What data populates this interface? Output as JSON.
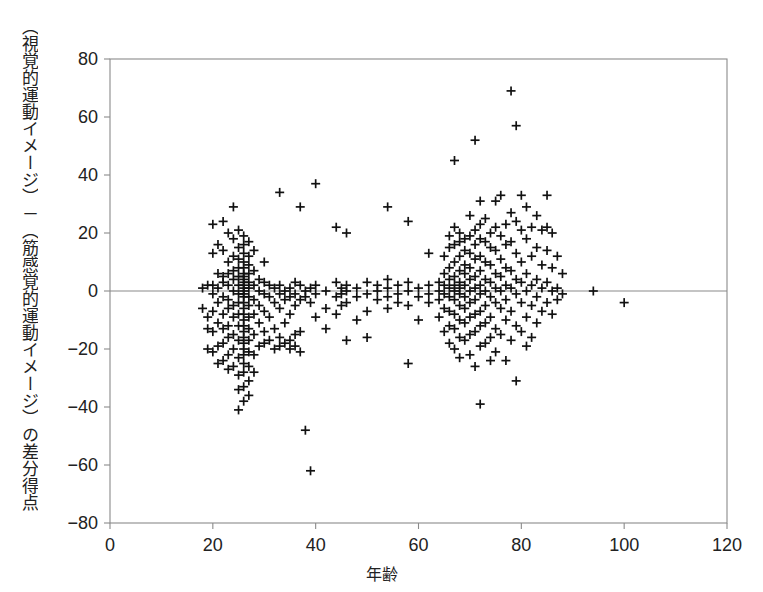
{
  "figure": {
    "ylabel": "（視覚的運動イメージ）－（筋感覚的運動イメージ）の差分得点",
    "xlabel": "年齢",
    "background": "#ffffff",
    "marker_color": "#111111",
    "axis_color": "#8a8a8a"
  },
  "chart_data": {
    "type": "scatter",
    "title": "",
    "xlabel": "年齢",
    "ylabel": "（視覚的運動イメージ）－（筋感覚的運動イメージ）の差分得点",
    "xlim": [
      0,
      120
    ],
    "ylim": [
      -80,
      80
    ],
    "xticks": [
      0,
      20,
      40,
      60,
      80,
      100,
      120
    ],
    "yticks": [
      -80,
      -60,
      -40,
      -20,
      0,
      20,
      40,
      60,
      80
    ],
    "xtick_labels": [
      "0",
      "20",
      "40",
      "60",
      "80",
      "100",
      "120"
    ],
    "ytick_labels": [
      "-80",
      "-60",
      "-40",
      "-20",
      "0",
      "20",
      "40",
      "60",
      "80"
    ],
    "grid": false,
    "legend": false,
    "marker": "plus",
    "zero_line": 0,
    "n_points": 286,
    "points": [
      [
        18,
        1
      ],
      [
        18,
        -6
      ],
      [
        19,
        2
      ],
      [
        19,
        -13
      ],
      [
        19,
        -20
      ],
      [
        19,
        -9
      ],
      [
        20,
        23
      ],
      [
        20,
        13
      ],
      [
        20,
        2
      ],
      [
        20,
        -1
      ],
      [
        20,
        -7
      ],
      [
        20,
        -14
      ],
      [
        20,
        -21
      ],
      [
        21,
        16
      ],
      [
        21,
        6
      ],
      [
        21,
        1
      ],
      [
        21,
        -4
      ],
      [
        21,
        -11
      ],
      [
        21,
        -19
      ],
      [
        21,
        -25
      ],
      [
        22,
        24
      ],
      [
        22,
        14
      ],
      [
        22,
        5
      ],
      [
        22,
        3
      ],
      [
        22,
        -2
      ],
      [
        22,
        -8
      ],
      [
        22,
        -13
      ],
      [
        22,
        -18
      ],
      [
        22,
        -24
      ],
      [
        23,
        20
      ],
      [
        23,
        10
      ],
      [
        23,
        6
      ],
      [
        23,
        2
      ],
      [
        23,
        -3
      ],
      [
        23,
        -6
      ],
      [
        23,
        -12
      ],
      [
        23,
        -16
      ],
      [
        23,
        -22
      ],
      [
        23,
        -27
      ],
      [
        24,
        29
      ],
      [
        24,
        18
      ],
      [
        24,
        12
      ],
      [
        24,
        7
      ],
      [
        24,
        4
      ],
      [
        24,
        0
      ],
      [
        24,
        -5
      ],
      [
        24,
        -9
      ],
      [
        24,
        -15
      ],
      [
        24,
        -20
      ],
      [
        24,
        -26
      ],
      [
        25,
        21
      ],
      [
        25,
        15
      ],
      [
        25,
        11
      ],
      [
        25,
        8
      ],
      [
        25,
        5
      ],
      [
        25,
        2
      ],
      [
        25,
        -1
      ],
      [
        25,
        -4
      ],
      [
        25,
        -8
      ],
      [
        25,
        -12
      ],
      [
        25,
        -17
      ],
      [
        25,
        -23
      ],
      [
        25,
        -29
      ],
      [
        25,
        -34
      ],
      [
        25,
        -41
      ],
      [
        26,
        19
      ],
      [
        26,
        16
      ],
      [
        26,
        13
      ],
      [
        26,
        10
      ],
      [
        26,
        8
      ],
      [
        26,
        6
      ],
      [
        26,
        5
      ],
      [
        26,
        4
      ],
      [
        26,
        3
      ],
      [
        26,
        2
      ],
      [
        26,
        1
      ],
      [
        26,
        0
      ],
      [
        26,
        -1
      ],
      [
        26,
        -2
      ],
      [
        26,
        -4
      ],
      [
        26,
        -6
      ],
      [
        26,
        -8
      ],
      [
        26,
        -10
      ],
      [
        26,
        -12
      ],
      [
        26,
        -14
      ],
      [
        26,
        -16
      ],
      [
        26,
        -18
      ],
      [
        26,
        -20
      ],
      [
        26,
        -22
      ],
      [
        26,
        -25
      ],
      [
        26,
        -28
      ],
      [
        26,
        -33
      ],
      [
        26,
        -38
      ],
      [
        27,
        17
      ],
      [
        27,
        12
      ],
      [
        27,
        9
      ],
      [
        27,
        6
      ],
      [
        27,
        3
      ],
      [
        27,
        1
      ],
      [
        27,
        -2
      ],
      [
        27,
        -5
      ],
      [
        27,
        -9
      ],
      [
        27,
        -13
      ],
      [
        27,
        -17
      ],
      [
        27,
        -21
      ],
      [
        27,
        -26
      ],
      [
        27,
        -31
      ],
      [
        27,
        -36
      ],
      [
        28,
        14
      ],
      [
        28,
        7
      ],
      [
        28,
        2
      ],
      [
        28,
        -3
      ],
      [
        28,
        -8
      ],
      [
        28,
        -15
      ],
      [
        28,
        -22
      ],
      [
        28,
        -28
      ],
      [
        29,
        4
      ],
      [
        29,
        0
      ],
      [
        29,
        -5
      ],
      [
        29,
        -11
      ],
      [
        29,
        -19
      ],
      [
        30,
        10
      ],
      [
        30,
        3
      ],
      [
        30,
        -1
      ],
      [
        30,
        -7
      ],
      [
        30,
        -14
      ],
      [
        30,
        -18
      ],
      [
        31,
        2
      ],
      [
        31,
        -2
      ],
      [
        31,
        -9
      ],
      [
        31,
        -17
      ],
      [
        32,
        1
      ],
      [
        32,
        -4
      ],
      [
        32,
        -13
      ],
      [
        32,
        -20
      ],
      [
        33,
        34
      ],
      [
        33,
        2
      ],
      [
        33,
        -1
      ],
      [
        33,
        -6
      ],
      [
        33,
        -16
      ],
      [
        33,
        -19
      ],
      [
        34,
        0
      ],
      [
        34,
        -3
      ],
      [
        34,
        -11
      ],
      [
        34,
        -18
      ],
      [
        35,
        1
      ],
      [
        35,
        -2
      ],
      [
        35,
        -8
      ],
      [
        35,
        -17
      ],
      [
        35,
        -20
      ],
      [
        36,
        3
      ],
      [
        36,
        -1
      ],
      [
        36,
        -5
      ],
      [
        36,
        -15
      ],
      [
        36,
        -19
      ],
      [
        37,
        29
      ],
      [
        37,
        2
      ],
      [
        37,
        -3
      ],
      [
        37,
        -14
      ],
      [
        37,
        -21
      ],
      [
        38,
        0
      ],
      [
        38,
        -2
      ],
      [
        38,
        -48
      ],
      [
        39,
        1
      ],
      [
        39,
        -4
      ],
      [
        39,
        -62
      ],
      [
        40,
        37
      ],
      [
        40,
        2
      ],
      [
        40,
        -1
      ],
      [
        40,
        -9
      ],
      [
        42,
        0
      ],
      [
        42,
        -6
      ],
      [
        42,
        -13
      ],
      [
        44,
        22
      ],
      [
        44,
        3
      ],
      [
        44,
        -2
      ],
      [
        44,
        -8
      ],
      [
        45,
        1
      ],
      [
        45,
        -1
      ],
      [
        45,
        -5
      ],
      [
        46,
        20
      ],
      [
        46,
        2
      ],
      [
        46,
        0
      ],
      [
        46,
        -4
      ],
      [
        46,
        -17
      ],
      [
        48,
        1
      ],
      [
        48,
        -2
      ],
      [
        48,
        -10
      ],
      [
        50,
        3
      ],
      [
        50,
        -1
      ],
      [
        50,
        -7
      ],
      [
        50,
        -16
      ],
      [
        52,
        2
      ],
      [
        52,
        0
      ],
      [
        52,
        -3
      ],
      [
        54,
        29
      ],
      [
        54,
        4
      ],
      [
        54,
        1
      ],
      [
        54,
        -2
      ],
      [
        54,
        -6
      ],
      [
        56,
        2
      ],
      [
        56,
        -1
      ],
      [
        56,
        -4
      ],
      [
        58,
        24
      ],
      [
        58,
        3
      ],
      [
        58,
        0
      ],
      [
        58,
        -5
      ],
      [
        58,
        -25
      ],
      [
        60,
        1
      ],
      [
        60,
        -2
      ],
      [
        60,
        -10
      ],
      [
        62,
        13
      ],
      [
        62,
        2
      ],
      [
        62,
        -1
      ],
      [
        62,
        -4
      ],
      [
        64,
        3
      ],
      [
        64,
        0
      ],
      [
        64,
        -3
      ],
      [
        64,
        -9
      ],
      [
        65,
        12
      ],
      [
        65,
        6
      ],
      [
        65,
        2
      ],
      [
        65,
        -1
      ],
      [
        65,
        -6
      ],
      [
        65,
        -14
      ],
      [
        66,
        19
      ],
      [
        66,
        15
      ],
      [
        66,
        8
      ],
      [
        66,
        4
      ],
      [
        66,
        1
      ],
      [
        66,
        -2
      ],
      [
        66,
        -7
      ],
      [
        66,
        -12
      ],
      [
        66,
        -18
      ],
      [
        67,
        45
      ],
      [
        67,
        22
      ],
      [
        67,
        16
      ],
      [
        67,
        10
      ],
      [
        67,
        5
      ],
      [
        67,
        2
      ],
      [
        67,
        0
      ],
      [
        67,
        -3
      ],
      [
        67,
        -8
      ],
      [
        67,
        -13
      ],
      [
        67,
        -20
      ],
      [
        68,
        20
      ],
      [
        68,
        17
      ],
      [
        68,
        12
      ],
      [
        68,
        7
      ],
      [
        68,
        3
      ],
      [
        68,
        1
      ],
      [
        68,
        -1
      ],
      [
        68,
        -5
      ],
      [
        68,
        -10
      ],
      [
        68,
        -16
      ],
      [
        68,
        -23
      ],
      [
        69,
        18
      ],
      [
        69,
        14
      ],
      [
        69,
        9
      ],
      [
        69,
        6
      ],
      [
        69,
        2
      ],
      [
        69,
        -2
      ],
      [
        69,
        -6
      ],
      [
        69,
        -11
      ],
      [
        69,
        -17
      ],
      [
        70,
        26
      ],
      [
        70,
        19
      ],
      [
        70,
        13
      ],
      [
        70,
        8
      ],
      [
        70,
        4
      ],
      [
        70,
        0
      ],
      [
        70,
        -4
      ],
      [
        70,
        -9
      ],
      [
        70,
        -15
      ],
      [
        70,
        -22
      ],
      [
        71,
        52
      ],
      [
        71,
        21
      ],
      [
        71,
        16
      ],
      [
        71,
        11
      ],
      [
        71,
        5
      ],
      [
        71,
        1
      ],
      [
        71,
        -3
      ],
      [
        71,
        -8
      ],
      [
        71,
        -14
      ],
      [
        71,
        -26
      ],
      [
        72,
        31
      ],
      [
        72,
        23
      ],
      [
        72,
        18
      ],
      [
        72,
        12
      ],
      [
        72,
        7
      ],
      [
        72,
        2
      ],
      [
        72,
        -1
      ],
      [
        72,
        -7
      ],
      [
        72,
        -12
      ],
      [
        72,
        -19
      ],
      [
        72,
        -39
      ],
      [
        73,
        25
      ],
      [
        73,
        17
      ],
      [
        73,
        10
      ],
      [
        73,
        4
      ],
      [
        73,
        0
      ],
      [
        73,
        -5
      ],
      [
        73,
        -11
      ],
      [
        73,
        -18
      ],
      [
        74,
        20
      ],
      [
        74,
        15
      ],
      [
        74,
        9
      ],
      [
        74,
        3
      ],
      [
        74,
        -2
      ],
      [
        74,
        -9
      ],
      [
        74,
        -16
      ],
      [
        74,
        -24
      ],
      [
        75,
        31
      ],
      [
        75,
        22
      ],
      [
        75,
        14
      ],
      [
        75,
        6
      ],
      [
        75,
        1
      ],
      [
        75,
        -4
      ],
      [
        75,
        -13
      ],
      [
        75,
        -21
      ],
      [
        76,
        33
      ],
      [
        76,
        19
      ],
      [
        76,
        11
      ],
      [
        76,
        5
      ],
      [
        76,
        0
      ],
      [
        76,
        -6
      ],
      [
        76,
        -15
      ],
      [
        77,
        23
      ],
      [
        77,
        16
      ],
      [
        77,
        8
      ],
      [
        77,
        2
      ],
      [
        77,
        -3
      ],
      [
        77,
        -10
      ],
      [
        77,
        -24
      ],
      [
        78,
        69
      ],
      [
        78,
        27
      ],
      [
        78,
        17
      ],
      [
        78,
        7
      ],
      [
        78,
        1
      ],
      [
        78,
        -7
      ],
      [
        78,
        -17
      ],
      [
        79,
        57
      ],
      [
        79,
        24
      ],
      [
        79,
        13
      ],
      [
        79,
        4
      ],
      [
        79,
        -1
      ],
      [
        79,
        -12
      ],
      [
        79,
        -31
      ],
      [
        80,
        33
      ],
      [
        80,
        21
      ],
      [
        80,
        10
      ],
      [
        80,
        3
      ],
      [
        80,
        -4
      ],
      [
        80,
        -14
      ],
      [
        81,
        29
      ],
      [
        81,
        18
      ],
      [
        81,
        6
      ],
      [
        81,
        0
      ],
      [
        81,
        -9
      ],
      [
        81,
        -19
      ],
      [
        82,
        22
      ],
      [
        82,
        12
      ],
      [
        82,
        2
      ],
      [
        82,
        -5
      ],
      [
        82,
        -16
      ],
      [
        83,
        26
      ],
      [
        83,
        15
      ],
      [
        83,
        4
      ],
      [
        83,
        -2
      ],
      [
        83,
        -11
      ],
      [
        84,
        21
      ],
      [
        84,
        9
      ],
      [
        84,
        1
      ],
      [
        84,
        -7
      ],
      [
        85,
        33
      ],
      [
        85,
        22
      ],
      [
        85,
        14
      ],
      [
        85,
        3
      ],
      [
        85,
        -4
      ],
      [
        86,
        20
      ],
      [
        86,
        8
      ],
      [
        86,
        0
      ],
      [
        86,
        -8
      ],
      [
        87,
        12
      ],
      [
        87,
        1
      ],
      [
        87,
        -3
      ],
      [
        88,
        6
      ],
      [
        88,
        -1
      ],
      [
        94,
        0
      ],
      [
        100,
        -4
      ]
    ]
  }
}
